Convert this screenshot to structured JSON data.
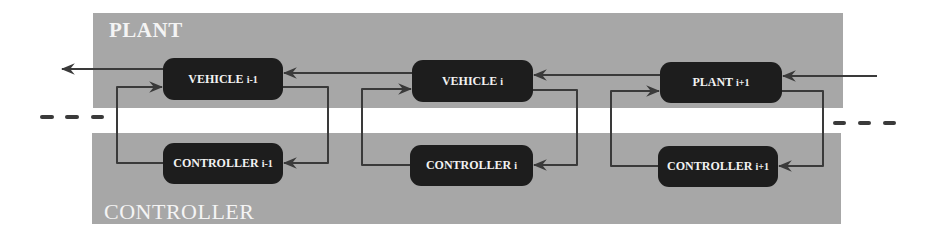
{
  "bands": {
    "plant": {
      "title": "PLANT"
    },
    "controller": {
      "title": "CONTROLLER"
    }
  },
  "boxes": {
    "vehicle_im1": {
      "label": "VEHICLE",
      "index": "i-1"
    },
    "controller_im1": {
      "label": "CONTROLLER",
      "index": "i-1"
    },
    "vehicle_i": {
      "label": "VEHICLE",
      "index": "i"
    },
    "controller_i": {
      "label": "CONTROLLER",
      "index": "i"
    },
    "plant_ip1": {
      "label": "PLANT",
      "index": "i+1"
    },
    "controller_ip1": {
      "label": "CONTROLLER",
      "index": "i+1"
    }
  },
  "edges": [
    {
      "from": "vehicle_im1",
      "to": "output-left"
    },
    {
      "from": "vehicle_i",
      "to": "vehicle_im1"
    },
    {
      "from": "plant_ip1",
      "to": "vehicle_i"
    },
    {
      "from": "input-right",
      "to": "plant_ip1"
    },
    {
      "from": "controller_im1",
      "to": "vehicle_im1"
    },
    {
      "from": "vehicle_im1",
      "to": "controller_im1"
    },
    {
      "from": "controller_i",
      "to": "vehicle_i"
    },
    {
      "from": "vehicle_i",
      "to": "controller_i"
    },
    {
      "from": "controller_ip1",
      "to": "plant_ip1"
    },
    {
      "from": "plant_ip1",
      "to": "controller_ip1"
    }
  ],
  "continuation": {
    "left": "ellipsis-dashes",
    "right": "ellipsis-dashes"
  },
  "colors": {
    "band": "#a7a7a7",
    "box": "#1d1d1d",
    "box_text": "#f2f2f2",
    "wire": "#3a3a3a"
  }
}
